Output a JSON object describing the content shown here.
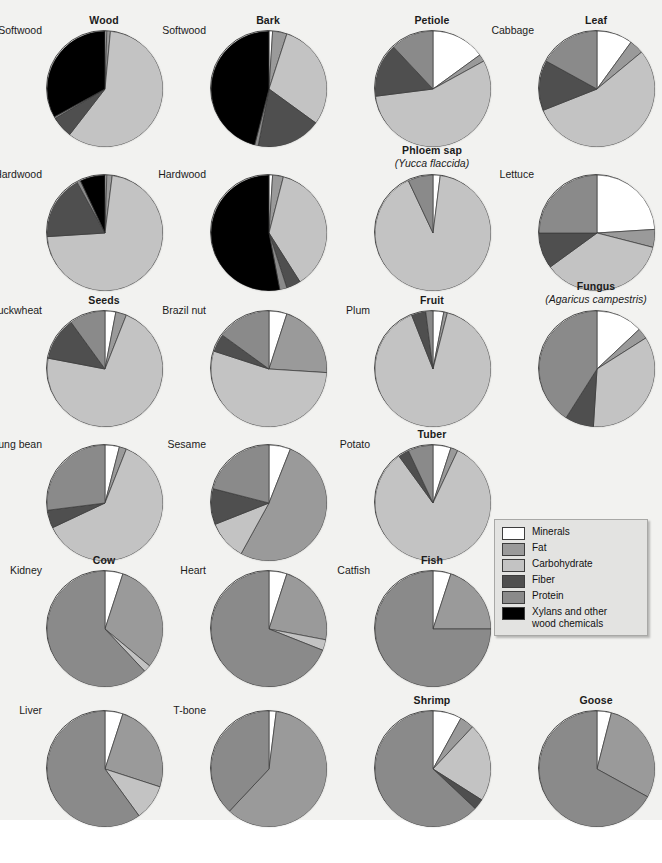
{
  "legend": {
    "title": "Composition legend",
    "entries": [
      {
        "label": "Minerals",
        "color": "#ffffff"
      },
      {
        "label": "Fat",
        "color": "#9a9a9a"
      },
      {
        "label": "Carbohydrate",
        "color": "#c3c3c3"
      },
      {
        "label": "Fiber",
        "color": "#4f4f4f"
      },
      {
        "label": "Protein",
        "color": "#8a8a8a"
      },
      {
        "label": "Xylans and other\nwood chemicals",
        "color": "#000000"
      }
    ]
  },
  "chart_data": {
    "type": "pie",
    "categories": [
      "Minerals",
      "Fat",
      "Carbohydrate",
      "Fiber",
      "Protein",
      "Xylans and other wood chemicals"
    ],
    "colors": [
      "#ffffff",
      "#9a9a9a",
      "#c3c3c3",
      "#4f4f4f",
      "#8a8a8a",
      "#000000"
    ],
    "legend_position": "center-right",
    "units": "percent of dry mass",
    "charts": [
      {
        "group": "Wood",
        "sub": "",
        "item": "Softwood",
        "values": [
          0.5,
          1.0,
          59.0,
          6.0,
          0.5,
          33.0
        ]
      },
      {
        "group": "Bark",
        "sub": "",
        "item": "Softwood",
        "values": [
          1.0,
          4.0,
          30.0,
          18.0,
          1.0,
          46.0
        ]
      },
      {
        "group": "Petiole",
        "sub": "",
        "item": "",
        "values": [
          15.0,
          2.0,
          56.0,
          15.0,
          12.0,
          0.0
        ]
      },
      {
        "group": "Leaf",
        "sub": "",
        "item": "Cabbage",
        "values": [
          10.0,
          4.0,
          55.0,
          14.0,
          17.0,
          0.0
        ]
      },
      {
        "group": "",
        "sub": "",
        "item": "Hardwood",
        "values": [
          0.5,
          1.5,
          72.0,
          18.0,
          1.0,
          7.0
        ]
      },
      {
        "group": "",
        "sub": "",
        "item": "Hardwood",
        "values": [
          1.0,
          3.0,
          37.0,
          4.0,
          2.0,
          53.0
        ]
      },
      {
        "group": "Phloem sap",
        "sub": "(Yucca flaccida)",
        "item": "",
        "values": [
          2.0,
          0.0,
          91.0,
          0.0,
          7.0,
          0.0
        ]
      },
      {
        "group": "",
        "sub": "",
        "item": "Lettuce",
        "values": [
          24.0,
          5.0,
          36.0,
          10.0,
          25.0,
          0.0
        ]
      },
      {
        "group": "Seeds",
        "sub": "",
        "item": "Buckwheat",
        "values": [
          3.0,
          3.0,
          72.0,
          12.0,
          10.0,
          0.0
        ]
      },
      {
        "group": "",
        "sub": "",
        "item": "Brazil nut",
        "values": [
          5.0,
          21.0,
          54.0,
          5.0,
          15.0,
          0.0
        ]
      },
      {
        "group": "Fruit",
        "sub": "",
        "item": "Plum",
        "values": [
          3.0,
          1.0,
          90.0,
          4.0,
          2.0,
          0.0
        ]
      },
      {
        "group": "Fungus",
        "sub": "(Agaricus campestris)",
        "item": "",
        "values": [
          13.0,
          3.0,
          35.0,
          8.0,
          41.0,
          0.0
        ]
      },
      {
        "group": "",
        "sub": "",
        "item": "Mung bean",
        "values": [
          4.0,
          2.0,
          62.0,
          5.0,
          27.0,
          0.0
        ]
      },
      {
        "group": "",
        "sub": "",
        "item": "Sesame",
        "values": [
          6.0,
          52.0,
          11.0,
          10.0,
          21.0,
          0.0
        ]
      },
      {
        "group": "Tuber",
        "sub": "",
        "item": "Potato",
        "values": [
          5.0,
          2.0,
          83.0,
          3.0,
          7.0,
          0.0
        ]
      },
      {
        "group": "",
        "sub": "",
        "item": "",
        "values": [
          0,
          0,
          0,
          0,
          0,
          0
        ]
      },
      {
        "group": "Cow",
        "sub": "",
        "item": "Kidney",
        "values": [
          5.0,
          31.0,
          2.0,
          0.0,
          62.0,
          0.0
        ]
      },
      {
        "group": "",
        "sub": "",
        "item": "Heart",
        "values": [
          5.0,
          23.0,
          3.0,
          0.0,
          69.0,
          0.0
        ]
      },
      {
        "group": "Fish",
        "sub": "",
        "item": "Catfish",
        "values": [
          5.0,
          20.0,
          0.0,
          0.0,
          75.0,
          0.0
        ]
      },
      {
        "group": "",
        "sub": "",
        "item": "",
        "values": [
          0,
          0,
          0,
          0,
          0,
          0
        ]
      },
      {
        "group": "",
        "sub": "",
        "item": "Liver",
        "values": [
          5.0,
          25.0,
          10.0,
          0.0,
          60.0,
          0.0
        ]
      },
      {
        "group": "",
        "sub": "",
        "item": "T-bone",
        "values": [
          2.0,
          60.0,
          0.0,
          0.0,
          38.0,
          0.0
        ]
      },
      {
        "group": "Shrimp",
        "sub": "",
        "item": "",
        "values": [
          8.0,
          4.0,
          22.0,
          3.0,
          63.0,
          0.0
        ]
      },
      {
        "group": "Goose",
        "sub": "",
        "item": "",
        "values": [
          4.0,
          29.0,
          0.0,
          0.0,
          67.0,
          0.0
        ]
      }
    ]
  },
  "caption": {
    "text": ""
  }
}
